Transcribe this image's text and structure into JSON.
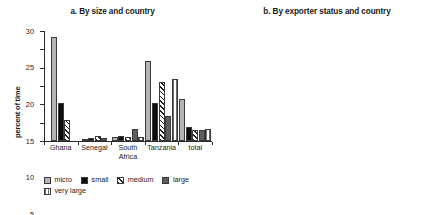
{
  "chart_data": [
    {
      "type": "bar",
      "panel_id": "a",
      "title": "a. By size and country",
      "xlabel": "",
      "ylabel": "percent of time",
      "ylim": [
        0,
        30
      ],
      "yticks": [
        0,
        5,
        10,
        15,
        20,
        25,
        30
      ],
      "grid": false,
      "legend_position": "bottom-left",
      "categories": [
        "Ghana",
        "Senegal",
        "South\nAfrica",
        "Tanzania",
        "total"
      ],
      "series": [
        {
          "name": "micro",
          "color": "#b4b4b4",
          "pattern": "solid",
          "values": [
            28.5,
            0.6,
            1.1,
            21.8,
            11.5
          ]
        },
        {
          "name": "small",
          "color": "#0d0d0d",
          "pattern": "solid",
          "values": [
            10.3,
            0.9,
            1.4,
            10.5,
            3.8
          ]
        },
        {
          "name": "medium",
          "color": "#1f1f1f",
          "pattern": "diagonal",
          "values": [
            5.8,
            1.5,
            1.1,
            16.2,
            2.9
          ]
        },
        {
          "name": "large",
          "color": "#5e5e5e",
          "pattern": "solid",
          "values": [
            0,
            0.8,
            3.4,
            6.7,
            3.0
          ]
        },
        {
          "name": "very large",
          "color": "#6a6a6a",
          "pattern": "vertical",
          "values": [
            0,
            0,
            1.2,
            17.0,
            3.2
          ]
        }
      ]
    },
    {
      "type": "bar",
      "panel_id": "b",
      "title": "b. By exporter status and country",
      "xlabel": "",
      "ylabel": "percent of time",
      "ylim": [
        0,
        12
      ],
      "yticks": [
        0,
        2,
        4,
        6,
        8,
        10,
        12
      ],
      "grid": false,
      "legend_position": "bottom-center",
      "categories": [
        "Ghana",
        "Senegal",
        "South\nAfrica",
        "Tanzania",
        "total"
      ],
      "series": [
        {
          "name": "nonexporter",
          "color": "#b0b0b0",
          "pattern": "solid",
          "values": [
            5.1,
            1.0,
            2.2,
            10.35,
            3.0
          ]
        },
        {
          "name": "exporter",
          "color": "#0d0d0d",
          "pattern": "solid",
          "values": [
            0,
            1.0,
            1.3,
            10.5,
            1.55
          ]
        }
      ]
    }
  ],
  "panel_a": {
    "title": "a. By size and country",
    "ylabel": "percent of time",
    "yticks": [
      "0",
      "5",
      "10",
      "15",
      "20",
      "25",
      "30"
    ],
    "categories": [
      "Ghana",
      "Senegal",
      "South\nAfrica",
      "Tanzania",
      "total"
    ],
    "legend": [
      "micro",
      "small",
      "medium",
      "large",
      "very large"
    ]
  },
  "panel_b": {
    "title": "b. By exporter status and country",
    "ylabel": "percent of time",
    "yticks": [
      "0",
      "2",
      "4",
      "6",
      "8",
      "10",
      "12"
    ],
    "categories": [
      "Ghana",
      "Senegal",
      "South\nAfrica",
      "Tanzania",
      "total"
    ],
    "legend": [
      "nonexporter",
      "exporter"
    ]
  }
}
